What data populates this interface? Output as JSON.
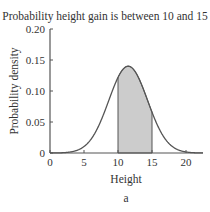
{
  "chart_data": {
    "type": "area",
    "title": "Probability height gain is between 10 and 15",
    "xlabel": "Height",
    "ylabel": "Probability density",
    "caption": "a",
    "xlim": [
      0,
      22.5
    ],
    "ylim": [
      0,
      0.2
    ],
    "xticks": [
      0,
      5,
      10,
      15,
      20
    ],
    "xtick_labels": [
      "0",
      "5",
      "10",
      "15",
      "20"
    ],
    "yticks": [
      0,
      0.05,
      0.1,
      0.15,
      0.2
    ],
    "ytick_labels": [
      "0",
      "0.05",
      "0.10",
      "0.15",
      "0.20"
    ],
    "distribution": {
      "name": "normal",
      "mean": 11.5,
      "sd": 2.85
    },
    "peak_density": 0.14,
    "shaded_interval": [
      10,
      15
    ],
    "grid": false,
    "colors": {
      "curve": "#555555",
      "shade": "#cccccc",
      "axis": "#555555"
    }
  }
}
